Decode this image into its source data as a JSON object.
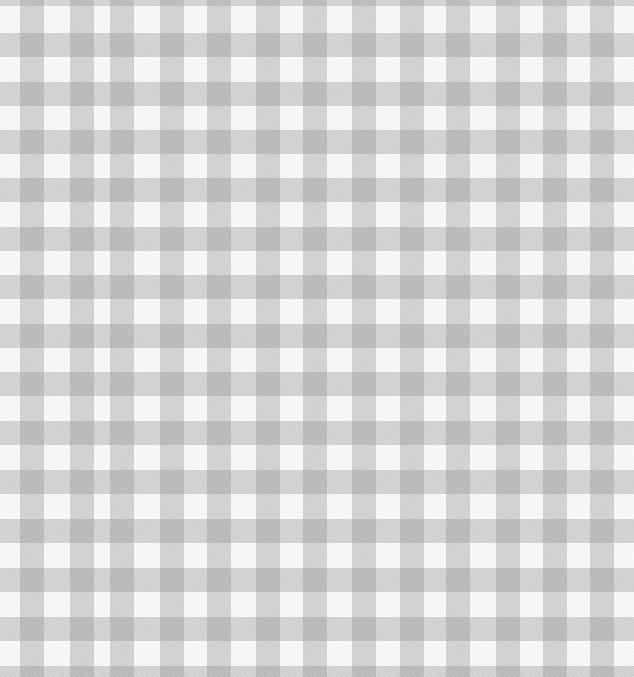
{
  "image": {
    "description": "Gray and white gingham check fabric pattern",
    "width": 634,
    "height": 677,
    "colors": {
      "background": "#fbfbfb",
      "stripe": "#d6d6d6",
      "intersection": "#9c9c9c"
    },
    "stripe_width": 24,
    "vertical_stripes_x": [
      20,
      70,
      110,
      160,
      207,
      256,
      303,
      352,
      400,
      446,
      496,
      543,
      590
    ],
    "horizontal_stripes_y": [
      33,
      82,
      130,
      178,
      227,
      275,
      324,
      372,
      421,
      470,
      519,
      568,
      617,
      666
    ]
  }
}
